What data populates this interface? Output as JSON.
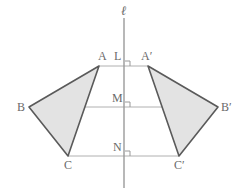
{
  "figure": {
    "mirror_line": {
      "name": "l",
      "label": "ℓ"
    },
    "labels": {
      "A": "A",
      "A_prime": "A′",
      "B": "B",
      "B_prime": "B′",
      "C": "C",
      "C_prime": "C′",
      "L": "L",
      "M": "M",
      "N": "N"
    },
    "colors": {
      "triangle_fill": "#e3e3e3",
      "triangle_stroke": "#5a5a5a",
      "connector_stroke": "#b0b0b0",
      "mirror_stroke": "#9a9a9a",
      "label_text": "#6a6a6a",
      "background": "#ffffff"
    },
    "points": {
      "A": {
        "x": 99,
        "y": 66
      },
      "A_prime": {
        "x": 148,
        "y": 66
      },
      "B": {
        "x": 29,
        "y": 107
      },
      "B_prime": {
        "x": 218,
        "y": 107
      },
      "C": {
        "x": 68,
        "y": 156
      },
      "C_prime": {
        "x": 179,
        "y": 156
      },
      "L": {
        "x": 124,
        "y": 66
      },
      "M": {
        "x": 124,
        "y": 107
      },
      "N": {
        "x": 124,
        "y": 156
      }
    },
    "mirror_segment": {
      "x": 124,
      "y1": 18,
      "y2": 188
    },
    "right_angle_markers": [
      {
        "x": 125,
        "y": 61,
        "size": 5
      },
      {
        "x": 125,
        "y": 102,
        "size": 5
      },
      {
        "x": 125,
        "y": 151,
        "size": 5
      }
    ],
    "connectors": [
      {
        "name": "A-to-A-prime",
        "x1": 99,
        "y1": 66,
        "x2": 148,
        "y2": 66
      },
      {
        "name": "B-to-B-prime",
        "x1": 29,
        "y1": 107,
        "x2": 218,
        "y2": 107
      },
      {
        "name": "C-to-C-prime",
        "x1": 68,
        "y1": 156,
        "x2": 179,
        "y2": 156
      }
    ]
  }
}
